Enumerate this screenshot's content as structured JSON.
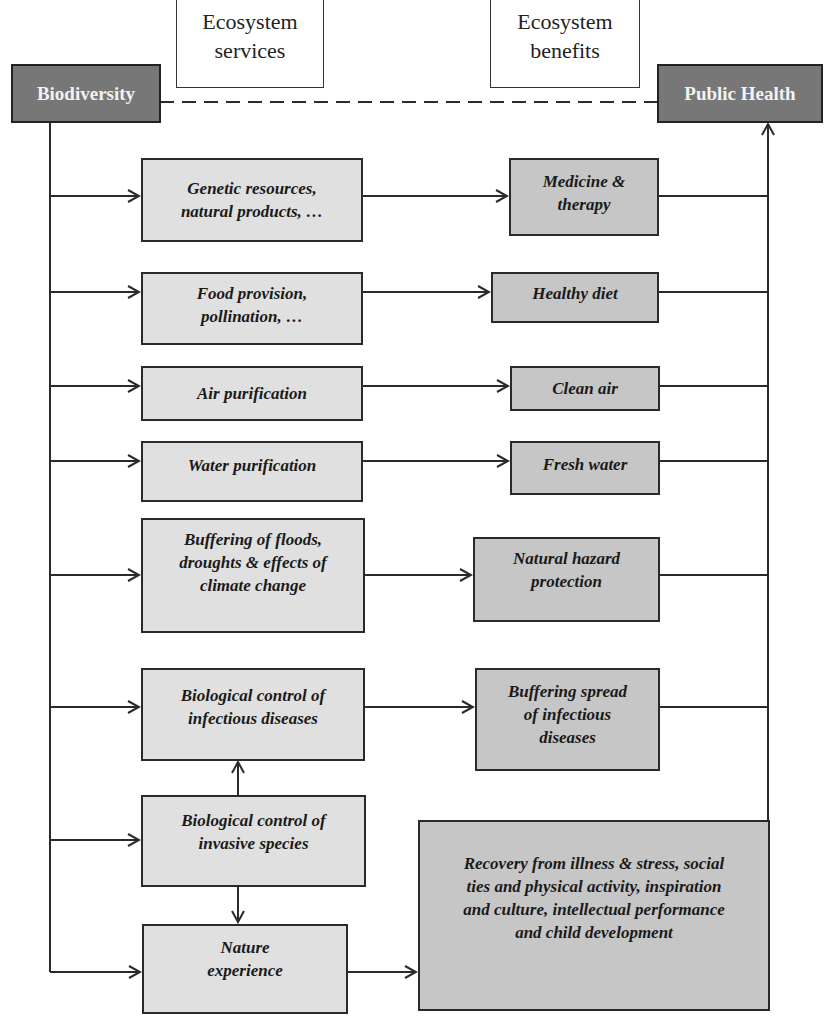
{
  "headers": {
    "services": "Ecosystem\nservices",
    "benefits": "Ecosystem\nbenefits"
  },
  "nodes": {
    "source": "Biodiversity",
    "target": "Public Health"
  },
  "services": [
    {
      "id": "genetic",
      "label": "Genetic resources,\nnatural products,  …"
    },
    {
      "id": "food",
      "label": "Food provision,\npollination, …"
    },
    {
      "id": "air",
      "label": "Air purification"
    },
    {
      "id": "water",
      "label": "Water purification"
    },
    {
      "id": "buffering",
      "label": "Buffering of floods,\ndroughts & effects of\nclimate change"
    },
    {
      "id": "bio-infectious",
      "label": "Biological control of\ninfectious diseases"
    },
    {
      "id": "bio-invasive",
      "label": "Biological control of\ninvasive species"
    },
    {
      "id": "nature",
      "label": "Nature\nexperience"
    }
  ],
  "benefits": [
    {
      "id": "medicine",
      "label": "Medicine &\ntherapy"
    },
    {
      "id": "diet",
      "label": "Healthy diet"
    },
    {
      "id": "clean-air",
      "label": "Clean air"
    },
    {
      "id": "fresh-water",
      "label": "Fresh water"
    },
    {
      "id": "hazard",
      "label": "Natural hazard\nprotection"
    },
    {
      "id": "spread",
      "label": "Buffering spread\nof infectious\ndiseases"
    },
    {
      "id": "recovery",
      "label": "Recovery from illness & stress, social\nties and physical activity, inspiration\nand culture, intellectual performance\nand child development"
    }
  ],
  "colors": {
    "dark_node": "#777777",
    "service_fill": "#e0e0e0",
    "benefit_fill": "#c6c6c6",
    "line": "#2a2a2a"
  }
}
